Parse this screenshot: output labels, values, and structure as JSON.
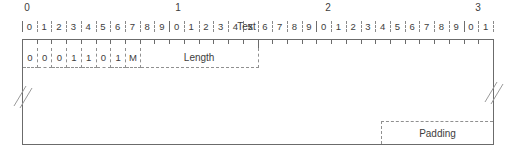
{
  "diagram": {
    "type": "bit-field-layout",
    "bit_width": 32,
    "colors": {
      "background": "#ffffff",
      "line": "#6b6b6b",
      "dashed_line": "#909090",
      "text": "#3d3d3d",
      "break_mark": "#9a9a9a"
    },
    "ruler": {
      "decade_labels": [
        "0",
        "1",
        "2",
        "3"
      ],
      "bit_numbers": [
        "0",
        "1",
        "2",
        "3",
        "4",
        "5",
        "6",
        "7",
        "8",
        "9",
        "0",
        "1",
        "2",
        "3",
        "4",
        "5",
        "6",
        "7",
        "8",
        "9",
        "0",
        "1",
        "2",
        "3",
        "4",
        "5",
        "6",
        "7",
        "8",
        "9",
        "0",
        "1"
      ]
    },
    "rows": [
      {
        "name": "header-row",
        "fields": [
          {
            "label": "0",
            "bits": 1,
            "kind": "bit"
          },
          {
            "label": "0",
            "bits": 1,
            "kind": "bit"
          },
          {
            "label": "0",
            "bits": 1,
            "kind": "bit"
          },
          {
            "label": "1",
            "bits": 1,
            "kind": "bit"
          },
          {
            "label": "1",
            "bits": 1,
            "kind": "bit"
          },
          {
            "label": "0",
            "bits": 1,
            "kind": "bit"
          },
          {
            "label": "1",
            "bits": 1,
            "kind": "bit"
          },
          {
            "label": "M",
            "bits": 1,
            "kind": "bit"
          },
          {
            "label": "Length",
            "bits": 8,
            "kind": "field"
          }
        ]
      },
      {
        "name": "text-row",
        "label": "Text",
        "truncated": true
      },
      {
        "name": "padding-row",
        "label": "Padding"
      }
    ]
  }
}
